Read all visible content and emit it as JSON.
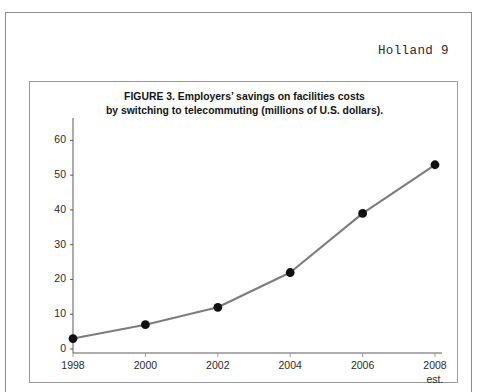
{
  "page": {
    "running_head": "Holland 9",
    "background_color": "#ffffff",
    "border_color": "#8d8d8d"
  },
  "figure": {
    "border_color": "#9a9a9a",
    "title_line1": "FIGURE 3. Employers’ savings on facilities costs",
    "title_line2": "by switching to telecommuting (millions of U.S. dollars)."
  },
  "chart_data": {
    "type": "line",
    "title": "FIGURE 3. Employers’ savings on facilities costs by switching to telecommuting (millions of U.S. dollars).",
    "xlabel": "",
    "ylabel": "",
    "categories": [
      "1998",
      "2000",
      "2002",
      "2004",
      "2006",
      "2008"
    ],
    "x_tick_sublabels": [
      "",
      "",
      "",
      "",
      "",
      "est."
    ],
    "values": [
      3,
      7,
      12,
      22,
      39,
      53
    ],
    "series": [
      {
        "name": "Employers' savings on facilities costs",
        "values": [
          3,
          7,
          12,
          22,
          39,
          53
        ]
      }
    ],
    "y_ticks": [
      0,
      10,
      20,
      30,
      40,
      50,
      60
    ],
    "ylim": [
      0,
      63
    ],
    "xlim": [
      "1998",
      "2008"
    ],
    "grid": false,
    "legend": "none",
    "line_color": "#7d7d7d",
    "marker_color": "#111111",
    "marker_shape": "circle",
    "axis_color": "#5a5a5a"
  }
}
